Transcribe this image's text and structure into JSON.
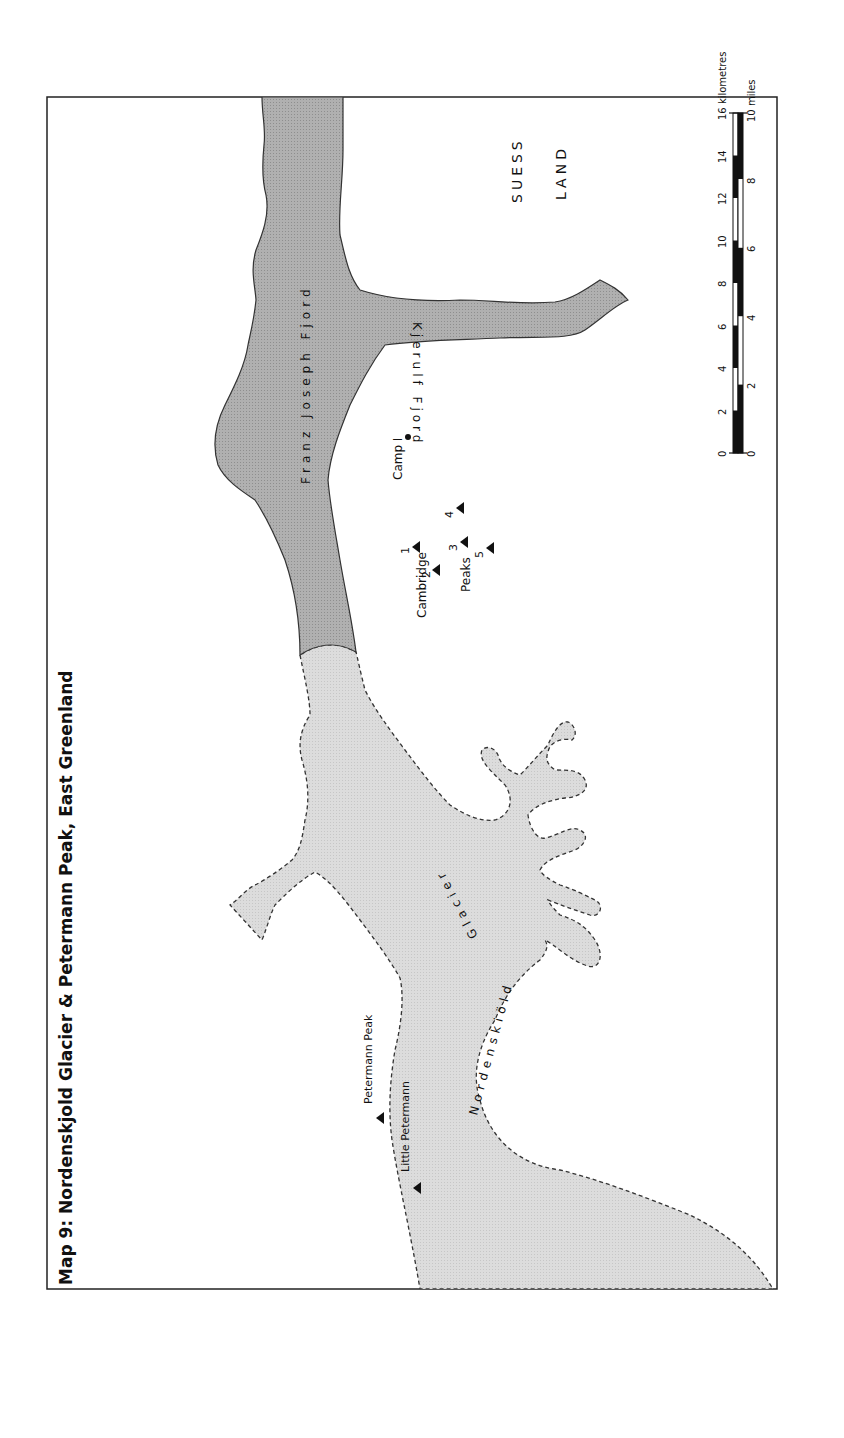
{
  "title": "Map 9: Nordenskjold Glacier & Petermann Peak, East Greenland",
  "colors": {
    "fjord_fill": "#a9a9a9",
    "glacier_fill": "#d9d9d9",
    "outline": "#333333",
    "frame": "#222222"
  },
  "regions": {
    "land_label_1": "SUESS",
    "land_label_2": "LAND"
  },
  "water": {
    "main_fjord": "Franz Joseph Fjord",
    "branch_fjord": "Kjerulf Fjord"
  },
  "glacier": {
    "name": "Nordenskiöld Glacier",
    "part1": "Nordenskiöld",
    "part2": "Glacier"
  },
  "features": {
    "camp": "Camp I",
    "cambridge_label": "Cambridge",
    "peaks_label": "Peaks",
    "peak_numbers": [
      "1",
      "2",
      "3",
      "4",
      "5"
    ],
    "petermann_peak": "Petermann Peak",
    "little_petermann": "Little Petermann"
  },
  "scale": {
    "km_label": "16 kilometres",
    "km_ticks": [
      "0",
      "2",
      "4",
      "6",
      "8",
      "10",
      "12",
      "14"
    ],
    "miles_label": "10 miles",
    "mile_ticks": [
      "0",
      "2",
      "4",
      "6",
      "8"
    ]
  }
}
